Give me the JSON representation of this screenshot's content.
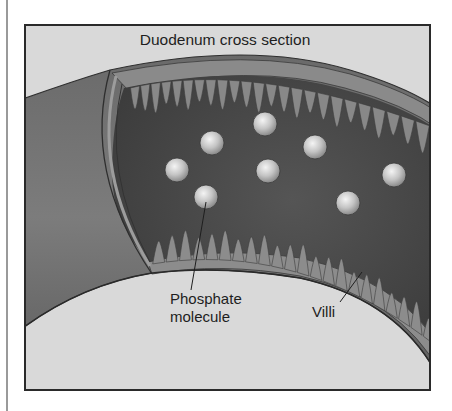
{
  "figure": {
    "title": "Duodenum cross section",
    "labels": {
      "phosphate_line1": "Phosphate",
      "phosphate_line2": "molecule",
      "villi": "Villi"
    },
    "colors": {
      "background": "#d9d9d9",
      "frame": "#2a2a2a",
      "outer_wall": "#767676",
      "lumen": "#474747",
      "villi": "#8c8c8c",
      "molecule": "#c9c9c9",
      "text": "#1e1e1e"
    },
    "phosphate_molecule_count": 8
  }
}
